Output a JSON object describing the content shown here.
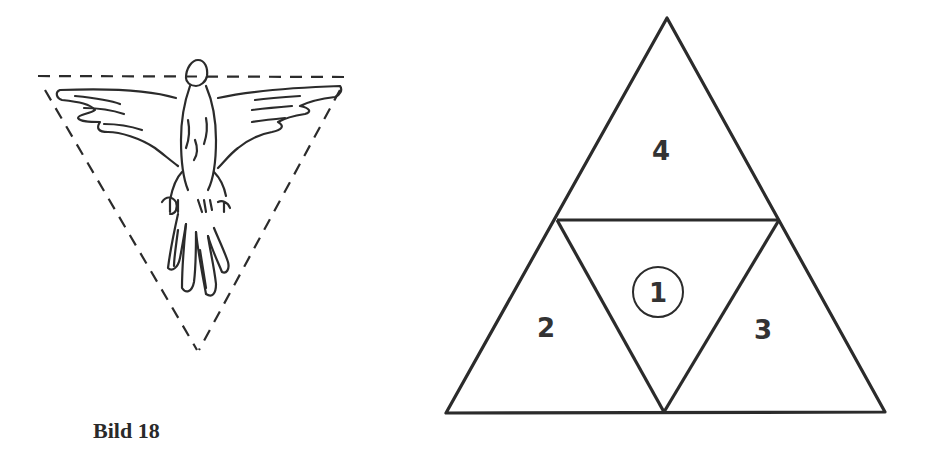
{
  "figure": {
    "caption": "Bild 18",
    "left_drawing": {
      "description": "Eagle/bird emblem with spread wings inside a dashed inverted triangle",
      "icon": "eagle-icon"
    },
    "right_drawing": {
      "description": "Large triangle subdivided into four smaller triangles",
      "regions": [
        {
          "id": "1",
          "label": "1",
          "position": "center (inverted)",
          "circled": true
        },
        {
          "id": "2",
          "label": "2",
          "position": "bottom-left"
        },
        {
          "id": "3",
          "label": "3",
          "position": "bottom-right"
        },
        {
          "id": "4",
          "label": "4",
          "position": "top"
        }
      ]
    },
    "stroke_color": "#2b2b2b",
    "background_color": "#ffffff"
  }
}
